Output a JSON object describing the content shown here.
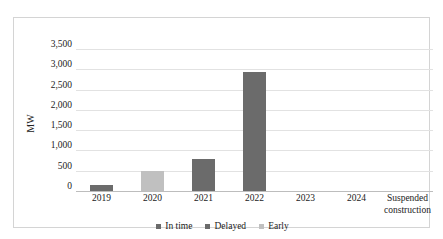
{
  "chart_data": {
    "type": "bar",
    "title": "",
    "subtitle": "",
    "xlabel": "",
    "ylabel": "MW",
    "ylim": [
      0,
      3500
    ],
    "ytick_step": 500,
    "ytick_labels": [
      "0",
      "500",
      "1,000",
      "1,500",
      "2,000",
      "2,500",
      "3,000",
      "3,500"
    ],
    "ytick_values": [
      0,
      500,
      1000,
      1500,
      2000,
      2500,
      3000,
      3500
    ],
    "grid": true,
    "legend_position": "bottom-center",
    "categories": [
      "2019",
      "2020",
      "2021",
      "2022",
      "2023",
      "2024",
      "Suspended construction"
    ],
    "category_lines": [
      [
        "2019"
      ],
      [
        "2020"
      ],
      [
        "2021"
      ],
      [
        "2022"
      ],
      [
        "2023"
      ],
      [
        "2024"
      ],
      [
        "Suspended",
        "construction"
      ]
    ],
    "series": [
      {
        "name": "In time",
        "color": "#6b6b6b",
        "values": [
          150,
          0,
          0,
          0,
          0,
          0,
          0
        ]
      },
      {
        "name": "Delayed",
        "color": "#6b6b6b",
        "values": [
          0,
          0,
          800,
          2930,
          0,
          0,
          0
        ]
      },
      {
        "name": "Early",
        "color": "#c0c0c0",
        "values": [
          0,
          500,
          0,
          0,
          0,
          0,
          0
        ]
      }
    ],
    "bars": [
      {
        "category": "2019",
        "value": 150,
        "series": "In time",
        "color": "#6b6b6b"
      },
      {
        "category": "2020",
        "value": 500,
        "series": "Early",
        "color": "#c0c0c0"
      },
      {
        "category": "2021",
        "value": 800,
        "series": "Delayed",
        "color": "#6b6b6b"
      },
      {
        "category": "2022",
        "value": 2930,
        "series": "Delayed",
        "color": "#6b6b6b"
      },
      {
        "category": "2023",
        "value": 0,
        "series": "",
        "color": "#6b6b6b"
      },
      {
        "category": "2024",
        "value": 0,
        "series": "",
        "color": "#6b6b6b"
      },
      {
        "category": "Suspended construction",
        "value": 0,
        "series": "",
        "color": "#6b6b6b"
      }
    ],
    "legend": [
      {
        "label": "In time",
        "color": "#6b6b6b"
      },
      {
        "label": "Delayed",
        "color": "#6b6b6b"
      },
      {
        "label": "Early",
        "color": "#c0c0c0"
      }
    ]
  },
  "colors": {
    "plot_background": "#ffffff",
    "frame_border": "#d4d4d4",
    "gridline": "#e2e2e2",
    "axis_line": "#bdbdbd",
    "text": "#222222"
  }
}
